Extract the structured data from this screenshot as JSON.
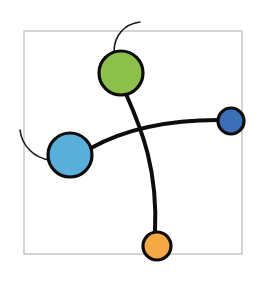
{
  "diagram": {
    "frame": {
      "x": 24,
      "y": 31,
      "width": 218,
      "height": 223,
      "color": "#b8b8c0"
    },
    "nodes": [
      {
        "id": "green-node",
        "cx": 121,
        "cy": 73,
        "r": 22,
        "color": "#8dc04a"
      },
      {
        "id": "light-blue-node",
        "cx": 70,
        "cy": 155,
        "r": 22,
        "color": "#5aaedc"
      },
      {
        "id": "dark-blue-node",
        "cx": 231,
        "cy": 121,
        "r": 13,
        "color": "#3b70b7"
      },
      {
        "id": "orange-node",
        "cx": 157,
        "cy": 246,
        "r": 14,
        "color": "#f5a844"
      }
    ],
    "edges": [
      {
        "id": "edge-lightblue-darkblue",
        "from": "light-blue-node",
        "to": "dark-blue-node",
        "weight": "thick"
      },
      {
        "id": "edge-green-orange",
        "from": "green-node",
        "to": "orange-node",
        "weight": "thick"
      }
    ],
    "tails": [
      {
        "id": "tail-green",
        "attached_to": "green-node",
        "weight": "thin"
      },
      {
        "id": "tail-lightblue",
        "attached_to": "light-blue-node",
        "weight": "thin"
      }
    ]
  }
}
